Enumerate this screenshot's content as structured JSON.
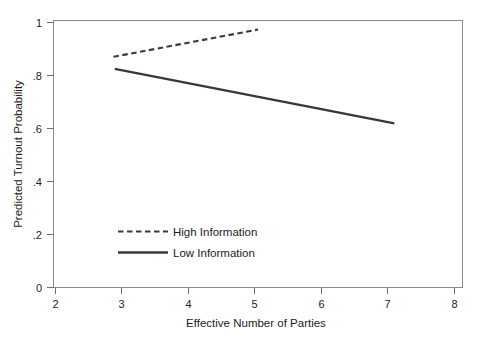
{
  "chart_data": {
    "type": "line",
    "title": "",
    "subtitle": "",
    "xlabel": "Effective Number of Parties",
    "ylabel": "Predicted Turnout Probability",
    "xlim": [
      2,
      8
    ],
    "ylim": [
      0,
      1
    ],
    "xticks": [
      "2",
      "3",
      "4",
      "5",
      "6",
      "7",
      "8"
    ],
    "yticks": [
      "0",
      ".2",
      ".4",
      ".6",
      ".8",
      "1"
    ],
    "xtick_values": [
      2,
      3,
      4,
      5,
      6,
      7,
      8
    ],
    "ytick_values": [
      0,
      0.2,
      0.4,
      0.6,
      0.8,
      1
    ],
    "grid": false,
    "legend_position": "inside-lower-left",
    "series": [
      {
        "name": "High Information",
        "style": "dashed",
        "color": "#3a3a3a",
        "x": [
          2.88,
          5.0
        ],
        "values": [
          0.864,
          0.966
        ]
      },
      {
        "name": "Low Information",
        "style": "solid",
        "color": "#383838",
        "x": [
          2.9,
          7.0
        ],
        "values": [
          0.819,
          0.615
        ]
      }
    ],
    "legend": [
      {
        "label": "High Information",
        "style": "dashed"
      },
      {
        "label": "Low Information",
        "style": "solid"
      }
    ],
    "colors": {
      "frame": "#8c8c8c",
      "tick": "#6e6e6e",
      "text": "#1c1c1c",
      "background": "#ffffff",
      "high_information": "#3a3a3a",
      "low_information": "#383838"
    }
  },
  "axes": {
    "x_title": "Effective Number of Parties",
    "y_title": "Predicted Turnout Probability",
    "x_tick_labels": [
      "2",
      "3",
      "4",
      "5",
      "6",
      "7",
      "8"
    ],
    "y_tick_labels": [
      "0",
      ".2",
      ".4",
      ".6",
      ".8",
      "1"
    ]
  },
  "legend": {
    "high_label": "High Information",
    "low_label": "Low Information"
  }
}
